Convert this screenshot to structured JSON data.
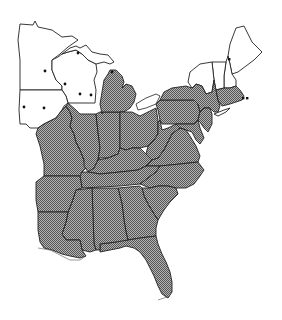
{
  "map": {
    "region": "Eastern United States",
    "style": "black-and-white range map",
    "legend": {
      "shaded": "states within range (stippled)",
      "dots": "isolated records outside main range"
    },
    "colors": {
      "shaded_fill": "#9a9a9a",
      "stipple_dark": "#555555",
      "border": "#222222",
      "background": "#ffffff",
      "dot": "#111111"
    },
    "shaded_states": [
      "Missouri",
      "Illinois",
      "Indiana",
      "Ohio",
      "Michigan (Lower)",
      "Kentucky",
      "West Virginia",
      "Pennsylvania",
      "New York",
      "Vermont (partial)",
      "Massachusetts",
      "Connecticut",
      "Rhode Island",
      "New Jersey",
      "Delaware",
      "Maryland",
      "Virginia",
      "Tennessee",
      "North Carolina",
      "South Carolina",
      "Georgia",
      "Florida",
      "Alabama",
      "Mississippi",
      "Arkansas",
      "Louisiana"
    ],
    "unshaded_states": [
      "Minnesota",
      "Wisconsin",
      "Iowa",
      "Michigan (Upper)",
      "Maine",
      "New Hampshire",
      "Vermont"
    ],
    "dot_records": [
      {
        "state": "Minnesota",
        "x": 45,
        "y": 71
      },
      {
        "state": "Michigan (Upper)",
        "x": 78,
        "y": 53
      },
      {
        "state": "Wisconsin",
        "x": 65,
        "y": 84
      },
      {
        "state": "Wisconsin",
        "x": 80,
        "y": 94
      },
      {
        "state": "Wisconsin",
        "x": 91,
        "y": 95
      },
      {
        "state": "Iowa",
        "x": 24,
        "y": 107
      },
      {
        "state": "Iowa",
        "x": 44,
        "y": 108
      },
      {
        "state": "Michigan (Lower)",
        "x": 112,
        "y": 72
      },
      {
        "state": "New Hampshire",
        "x": 229,
        "y": 59
      },
      {
        "state": "Massachusetts",
        "x": 243,
        "y": 98
      },
      {
        "state": "Massachusetts",
        "x": 247,
        "y": 98
      }
    ]
  }
}
